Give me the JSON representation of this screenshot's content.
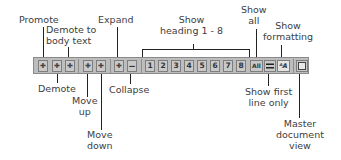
{
  "toolbar": {
    "buttons": [
      {
        "id": "promote",
        "glyph": ""
      },
      {
        "id": "demote",
        "glyph": ""
      },
      {
        "id": "demote-to-body-text",
        "glyph": ""
      },
      {
        "id": "move-up",
        "glyph": ""
      },
      {
        "id": "move-down",
        "glyph": ""
      },
      {
        "id": "expand",
        "glyph": ""
      },
      {
        "id": "collapse",
        "glyph": ""
      },
      {
        "id": "heading-1",
        "glyph": "1"
      },
      {
        "id": "heading-2",
        "glyph": "2"
      },
      {
        "id": "heading-3",
        "glyph": "3"
      },
      {
        "id": "heading-4",
        "glyph": "4"
      },
      {
        "id": "heading-5",
        "glyph": "5"
      },
      {
        "id": "heading-6",
        "glyph": "6"
      },
      {
        "id": "heading-7",
        "glyph": "7"
      },
      {
        "id": "heading-8",
        "glyph": "8"
      },
      {
        "id": "show-all",
        "glyph": "All"
      },
      {
        "id": "show-first-line-only",
        "glyph": ""
      },
      {
        "id": "show-formatting",
        "glyph": "ᴬA"
      },
      {
        "id": "master-document-view",
        "glyph": ""
      }
    ]
  },
  "labels": {
    "promote": "Promote",
    "demote_to_body_text": "Demote to\nbody text",
    "expand": "Expand",
    "show_heading": "Show\nheading 1 - 8",
    "show_all": "Show\nall",
    "show_formatting": "Show\nformatting",
    "demote": "Demote",
    "move_up": "Move\nup",
    "move_down": "Move\ndown",
    "collapse": "Collapse",
    "show_first_line_only": "Show first\nline only",
    "master_document_view": "Master\ndocument\nview"
  }
}
